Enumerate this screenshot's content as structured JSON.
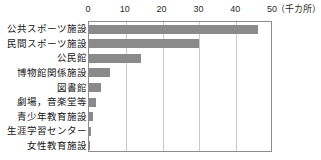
{
  "chart_data": {
    "type": "bar",
    "orientation": "horizontal",
    "title": "",
    "xlabel": "",
    "ylabel": "",
    "unit_label": "（千カ所）",
    "xlim": [
      0,
      50
    ],
    "xticks": [
      0,
      10,
      20,
      30,
      40,
      50
    ],
    "xtick_labels": [
      "0",
      "10",
      "20",
      "30",
      "40",
      "50"
    ],
    "grid": true,
    "grid_axis": "x",
    "legend": false,
    "bar_color": "#8a8a8a",
    "axis_color": "#8c8c8c",
    "gridline_color": "#c9c9c9",
    "categories": [
      "公共スポーツ施設",
      "民間スポーツ施設",
      "公民館",
      "博物館関係施設",
      "図書館",
      "劇場，音楽堂等",
      "青少年教育施設",
      "生涯学習センター",
      "女性教育施設"
    ],
    "values": [
      46.0,
      30.0,
      14.0,
      5.7,
      3.3,
      1.8,
      1.0,
      0.5,
      0.4
    ]
  }
}
